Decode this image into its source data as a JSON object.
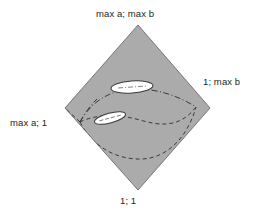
{
  "figure": {
    "type": "diagram",
    "colors": {
      "face_fill": "#ababab",
      "face_stroke": "#6f6f6f",
      "curve_stroke": "#3a3a3a",
      "ellipse_fill": "#ffffff",
      "ellipse_stroke": "#3a3a3a",
      "label_text": "#231f20",
      "background": "#ffffff"
    },
    "vertices": {
      "top": {
        "label": "max a; max b",
        "x": 138,
        "y": 25
      },
      "right": {
        "label": "1; max b",
        "x": 210,
        "y": 108
      },
      "bottom": {
        "label": "1; 1",
        "x": 138,
        "y": 190
      },
      "left": {
        "label": "max a; 1",
        "x": 65,
        "y": 108
      }
    },
    "interior_nodes": {
      "left_junction": {
        "x": 80,
        "y": 122
      },
      "right_junction": {
        "x": 196,
        "y": 107
      }
    },
    "curves": [
      {
        "name": "upper-dash-dot-curve",
        "style": "dash-dot"
      },
      {
        "name": "mid-dashed-curve",
        "style": "dashed"
      },
      {
        "name": "lower-dashed-curve",
        "style": "dashed"
      },
      {
        "name": "left-dash-dot-branch",
        "style": "dash-dot"
      }
    ],
    "ellipses": [
      {
        "name": "upper-ellipse",
        "cx": 132,
        "cy": 87,
        "rx": 21,
        "ry": 6,
        "rotate": -4
      },
      {
        "name": "lower-ellipse",
        "cx": 110,
        "cy": 118,
        "rx": 16,
        "ry": 5,
        "rotate": -14
      }
    ]
  }
}
